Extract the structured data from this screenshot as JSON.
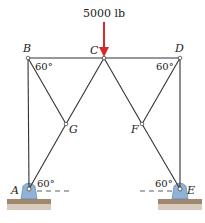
{
  "diagram": {
    "type": "truss",
    "load": {
      "label": "5000 lb",
      "node": "C",
      "direction": "down",
      "color": "#d42a2a"
    },
    "nodes": [
      {
        "id": "A",
        "label": "A",
        "x": 29,
        "y": 189
      },
      {
        "id": "B",
        "label": "B",
        "x": 28,
        "y": 58
      },
      {
        "id": "C",
        "label": "C",
        "x": 104,
        "y": 58
      },
      {
        "id": "D",
        "label": "D",
        "x": 180,
        "y": 58
      },
      {
        "id": "E",
        "label": "E",
        "x": 180,
        "y": 189
      },
      {
        "id": "F",
        "label": "F",
        "x": 142,
        "y": 124
      },
      {
        "id": "G",
        "label": "G",
        "x": 66,
        "y": 124
      }
    ],
    "members": [
      [
        "A",
        "B"
      ],
      [
        "B",
        "C"
      ],
      [
        "C",
        "D"
      ],
      [
        "D",
        "E"
      ],
      [
        "B",
        "G"
      ],
      [
        "G",
        "C"
      ],
      [
        "A",
        "G"
      ],
      [
        "C",
        "F"
      ],
      [
        "F",
        "D"
      ],
      [
        "F",
        "E"
      ]
    ],
    "angles": [
      {
        "at": "B",
        "label": "60°"
      },
      {
        "at": "D",
        "label": "60°"
      },
      {
        "at": "A",
        "label": "60°"
      },
      {
        "at": "E",
        "label": "60°"
      }
    ],
    "supports": [
      {
        "node": "A",
        "type": "pin",
        "color": "#8fb3d6"
      },
      {
        "node": "E",
        "type": "pin",
        "color": "#8fb3d6"
      }
    ],
    "ground_color": "#a08770"
  }
}
